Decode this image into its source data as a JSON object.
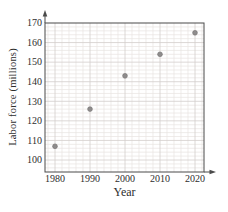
{
  "chart_data": {
    "type": "scatter",
    "x": [
      1980,
      1990,
      2000,
      2010,
      2020
    ],
    "values": [
      107,
      126,
      143,
      154,
      165
    ],
    "xlabel": "Year",
    "ylabel": "Labor force (millions)",
    "x_ticks": [
      "1980",
      "1990",
      "2000",
      "2010",
      "2020"
    ],
    "y_ticks": [
      "100",
      "110",
      "120",
      "130",
      "140",
      "150",
      "160",
      "170"
    ],
    "xlim": [
      1977.1,
      2022.6
    ],
    "ylim": [
      93.9,
      170
    ],
    "grid": "major+minor",
    "minor_step_x_years": 2,
    "minor_step_y_units": 2,
    "legend": "none",
    "colors": {
      "point": "#8e8c8c",
      "point_stroke": "#737171",
      "grid_major": "#d3cecb",
      "grid_minor": "#e8e4e1",
      "axis": "#4a4a4a",
      "text": "#2e2e2e",
      "background": "#ffffff"
    }
  }
}
